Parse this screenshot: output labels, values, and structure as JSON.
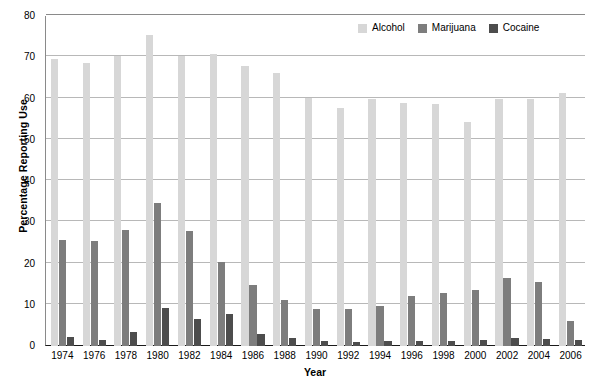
{
  "chart_data": {
    "type": "bar",
    "title": "",
    "xlabel": "Year",
    "ylabel": "Percentage Reporting Use",
    "ylim": [
      0,
      80
    ],
    "yticks": [
      0,
      10,
      20,
      30,
      40,
      50,
      60,
      70,
      80
    ],
    "grid": true,
    "legend_position": "top-right",
    "categories": [
      "1974",
      "1976",
      "1978",
      "1980",
      "1982",
      "1984",
      "1986",
      "1988",
      "1990",
      "1992",
      "1994",
      "1996",
      "1998",
      "2000",
      "2002",
      "2004",
      "2006"
    ],
    "series": [
      {
        "name": "Alcohol",
        "color": "#d7d7d7",
        "values": [
          69.5,
          68.6,
          70.2,
          75.4,
          70.2,
          70.8,
          67.8,
          66.2,
          60.2,
          57.8,
          60.0,
          59.0,
          58.6,
          54.3,
          59.9,
          59.9,
          61.4
        ]
      },
      {
        "name": "Marijuana",
        "color": "#7d7d7d",
        "values": [
          25.6,
          25.4,
          28.2,
          34.6,
          28.0,
          20.4,
          14.8,
          11.2,
          9.0,
          8.9,
          9.8,
          12.1,
          12.8,
          13.6,
          16.4,
          15.4,
          6.1
        ]
      },
      {
        "name": "Cocaine",
        "color": "#4d4d4d",
        "values": [
          2.3,
          1.5,
          3.5,
          9.1,
          6.5,
          7.8,
          3.0,
          2.0,
          1.2,
          0.9,
          1.1,
          1.3,
          1.3,
          1.4,
          2.0,
          1.6,
          1.4
        ]
      }
    ]
  },
  "axes": {
    "y_title": "Percentage Reporting Use",
    "x_title": "Year"
  }
}
